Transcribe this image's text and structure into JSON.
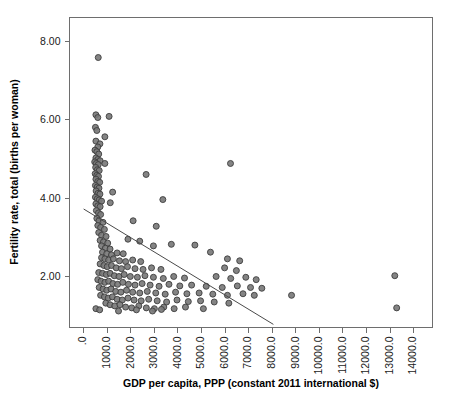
{
  "chart_data": {
    "type": "scatter",
    "title": "",
    "xlabel": "GDP per capita, PPP (constant 2011 international $)",
    "ylabel": "Fertility rate, total (births per woman)",
    "xlim": [
      -600,
      14800
    ],
    "ylim": [
      0.7,
      8.6
    ],
    "grid": false,
    "legend": null,
    "x_ticks": [
      0,
      1000,
      2000,
      3000,
      4000,
      5000,
      6000,
      7000,
      8000,
      9000,
      10000,
      11000,
      12000,
      13000,
      14000
    ],
    "x_tick_labels": [
      ".0",
      "1000.0",
      "2000.0",
      "3000.0",
      "4000.0",
      "5000.0",
      "6000.0",
      "7000.0",
      "8000.0",
      "9000.0",
      "10000.0",
      "11000.0",
      "12000.0",
      "13000.0",
      "14000.0"
    ],
    "y_ticks": [
      2,
      4,
      6,
      8
    ],
    "y_tick_labels": [
      "2.00",
      "4.00",
      "6.00",
      "8.00"
    ],
    "marker": {
      "shape": "circle",
      "fill_color": "#7a7a7a",
      "edge_color": "#3d3d3d",
      "size_px": 6
    },
    "fit_line": {
      "type": "linear-regression",
      "color": "#4a4a4a",
      "x_start": 0,
      "y_start": 3.72,
      "x_end": 8050,
      "y_end": 0.78
    },
    "series": [
      {
        "name": "Countries",
        "points": [
          [
            620,
            7.58
          ],
          [
            520,
            6.12
          ],
          [
            600,
            6.05
          ],
          [
            1080,
            6.08
          ],
          [
            500,
            5.8
          ],
          [
            560,
            5.72
          ],
          [
            900,
            5.56
          ],
          [
            520,
            5.45
          ],
          [
            690,
            5.38
          ],
          [
            600,
            5.3
          ],
          [
            480,
            5.22
          ],
          [
            560,
            5.18
          ],
          [
            640,
            5.12
          ],
          [
            520,
            5.02
          ],
          [
            600,
            4.98
          ],
          [
            700,
            4.95
          ],
          [
            470,
            4.92
          ],
          [
            540,
            4.88
          ],
          [
            620,
            4.85
          ],
          [
            900,
            4.88
          ],
          [
            6230,
            4.88
          ],
          [
            510,
            4.78
          ],
          [
            580,
            4.72
          ],
          [
            660,
            4.7
          ],
          [
            490,
            4.62
          ],
          [
            560,
            4.58
          ],
          [
            630,
            4.55
          ],
          [
            2650,
            4.6
          ],
          [
            520,
            4.48
          ],
          [
            600,
            4.42
          ],
          [
            680,
            4.4
          ],
          [
            500,
            4.32
          ],
          [
            575,
            4.28
          ],
          [
            650,
            4.25
          ],
          [
            530,
            4.18
          ],
          [
            610,
            4.12
          ],
          [
            690,
            4.1
          ],
          [
            1230,
            4.15
          ],
          [
            500,
            4.02
          ],
          [
            580,
            3.98
          ],
          [
            660,
            3.95
          ],
          [
            760,
            3.92
          ],
          [
            3360,
            3.96
          ],
          [
            520,
            3.85
          ],
          [
            600,
            3.8
          ],
          [
            700,
            3.78
          ],
          [
            1130,
            3.88
          ],
          [
            540,
            3.68
          ],
          [
            630,
            3.62
          ],
          [
            720,
            3.58
          ],
          [
            560,
            3.48
          ],
          [
            650,
            3.42
          ],
          [
            820,
            3.38
          ],
          [
            2100,
            3.42
          ],
          [
            600,
            3.3
          ],
          [
            720,
            3.25
          ],
          [
            880,
            3.2
          ],
          [
            3080,
            3.28
          ],
          [
            640,
            3.12
          ],
          [
            760,
            3.05
          ],
          [
            950,
            3.02
          ],
          [
            700,
            2.92
          ],
          [
            840,
            2.88
          ],
          [
            1020,
            2.85
          ],
          [
            1880,
            2.95
          ],
          [
            2380,
            2.9
          ],
          [
            760,
            2.78
          ],
          [
            920,
            2.72
          ],
          [
            1120,
            2.7
          ],
          [
            2960,
            2.78
          ],
          [
            3720,
            2.82
          ],
          [
            4720,
            2.8
          ],
          [
            800,
            2.62
          ],
          [
            980,
            2.58
          ],
          [
            1180,
            2.55
          ],
          [
            1420,
            2.6
          ],
          [
            1680,
            2.58
          ],
          [
            5380,
            2.62
          ],
          [
            760,
            2.48
          ],
          [
            900,
            2.45
          ],
          [
            1060,
            2.42
          ],
          [
            1260,
            2.45
          ],
          [
            1520,
            2.4
          ],
          [
            1780,
            2.38
          ],
          [
            2080,
            2.42
          ],
          [
            2420,
            2.38
          ],
          [
            6100,
            2.45
          ],
          [
            6620,
            2.4
          ],
          [
            700,
            2.32
          ],
          [
            860,
            2.28
          ],
          [
            1000,
            2.25
          ],
          [
            1180,
            2.28
          ],
          [
            1380,
            2.22
          ],
          [
            1600,
            2.2
          ],
          [
            1860,
            2.25
          ],
          [
            2180,
            2.2
          ],
          [
            2520,
            2.18
          ],
          [
            2880,
            2.22
          ],
          [
            3280,
            2.18
          ],
          [
            5980,
            2.22
          ],
          [
            6480,
            2.15
          ],
          [
            13200,
            2.02
          ],
          [
            640,
            2.1
          ],
          [
            800,
            2.08
          ],
          [
            960,
            2.05
          ],
          [
            1120,
            2.08
          ],
          [
            1300,
            2.02
          ],
          [
            1500,
            2.0
          ],
          [
            1720,
            2.05
          ],
          [
            1980,
            2.0
          ],
          [
            2280,
            1.98
          ],
          [
            2600,
            2.02
          ],
          [
            2960,
            1.98
          ],
          [
            3380,
            1.95
          ],
          [
            3820,
            2.0
          ],
          [
            4280,
            1.96
          ],
          [
            5620,
            2.0
          ],
          [
            6240,
            1.95
          ],
          [
            6880,
            1.98
          ],
          [
            7320,
            1.92
          ],
          [
            600,
            1.92
          ],
          [
            740,
            1.88
          ],
          [
            900,
            1.85
          ],
          [
            1060,
            1.88
          ],
          [
            1240,
            1.82
          ],
          [
            1440,
            1.8
          ],
          [
            1660,
            1.85
          ],
          [
            1900,
            1.8
          ],
          [
            2180,
            1.78
          ],
          [
            2480,
            1.82
          ],
          [
            2820,
            1.78
          ],
          [
            3200,
            1.75
          ],
          [
            3620,
            1.8
          ],
          [
            4080,
            1.76
          ],
          [
            4580,
            1.78
          ],
          [
            5200,
            1.75
          ],
          [
            5880,
            1.72
          ],
          [
            6520,
            1.76
          ],
          [
            7080,
            1.72
          ],
          [
            7560,
            1.7
          ],
          [
            660,
            1.72
          ],
          [
            820,
            1.68
          ],
          [
            980,
            1.65
          ],
          [
            1160,
            1.68
          ],
          [
            1360,
            1.62
          ],
          [
            1580,
            1.6
          ],
          [
            1820,
            1.65
          ],
          [
            2080,
            1.6
          ],
          [
            2380,
            1.58
          ],
          [
            2700,
            1.62
          ],
          [
            3060,
            1.58
          ],
          [
            3460,
            1.55
          ],
          [
            3900,
            1.6
          ],
          [
            4380,
            1.56
          ],
          [
            4900,
            1.58
          ],
          [
            5480,
            1.55
          ],
          [
            6100,
            1.52
          ],
          [
            6760,
            1.56
          ],
          [
            7240,
            1.52
          ],
          [
            8820,
            1.52
          ],
          [
            720,
            1.52
          ],
          [
            880,
            1.48
          ],
          [
            1040,
            1.45
          ],
          [
            1220,
            1.48
          ],
          [
            1420,
            1.42
          ],
          [
            1640,
            1.4
          ],
          [
            1880,
            1.45
          ],
          [
            2140,
            1.4
          ],
          [
            2440,
            1.38
          ],
          [
            2760,
            1.42
          ],
          [
            3120,
            1.38
          ],
          [
            3520,
            1.35
          ],
          [
            3960,
            1.4
          ],
          [
            4440,
            1.36
          ],
          [
            4960,
            1.38
          ],
          [
            5540,
            1.35
          ],
          [
            6160,
            1.32
          ],
          [
            940,
            1.32
          ],
          [
            1120,
            1.28
          ],
          [
            1320,
            1.25
          ],
          [
            1540,
            1.28
          ],
          [
            1780,
            1.22
          ],
          [
            2040,
            1.2
          ],
          [
            2340,
            1.25
          ],
          [
            2660,
            1.2
          ],
          [
            3000,
            1.18
          ],
          [
            3400,
            1.22
          ],
          [
            3840,
            1.18
          ],
          [
            4320,
            1.22
          ],
          [
            5080,
            1.18
          ],
          [
            520,
            1.18
          ],
          [
            680,
            1.15
          ],
          [
            1480,
            1.12
          ],
          [
            2240,
            1.15
          ],
          [
            2920,
            1.12
          ],
          [
            3300,
            1.16
          ],
          [
            13280,
            1.2
          ]
        ]
      }
    ]
  },
  "axis": {
    "x_title": "GDP per capita, PPP (constant 2011 international $)",
    "y_title": "Fertility rate, total (births per woman)"
  }
}
